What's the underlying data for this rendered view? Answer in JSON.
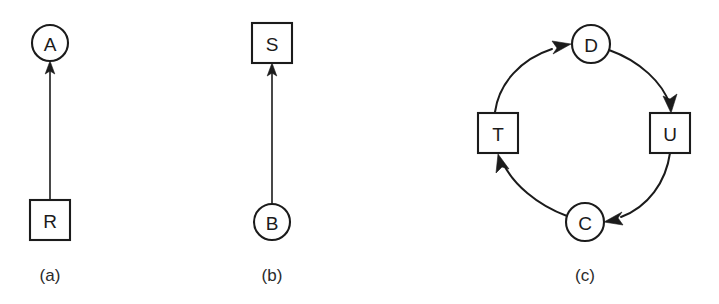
{
  "figure": {
    "width": 719,
    "height": 304,
    "background": "#ffffff",
    "ink": "#1b1b1b"
  },
  "panels": [
    {
      "caption": "(a)",
      "caption_pos": {
        "x": 50,
        "y": 275
      },
      "nodes": [
        {
          "id": "A",
          "label": "A",
          "shape": "circle",
          "cx": 50,
          "cy": 43,
          "r": 18
        },
        {
          "id": "R",
          "label": "R",
          "shape": "square",
          "x": 30,
          "y": 200,
          "w": 40,
          "h": 40
        }
      ],
      "edges": [
        {
          "from": "R",
          "to": "A",
          "kind": "straight",
          "x1": 50,
          "y1": 200,
          "x2": 50,
          "y2": 62,
          "arrow_at": "to"
        }
      ]
    },
    {
      "caption": "(b)",
      "caption_pos": {
        "x": 272,
        "y": 275
      },
      "nodes": [
        {
          "id": "S",
          "label": "S",
          "shape": "square",
          "x": 252,
          "y": 23,
          "w": 40,
          "h": 40
        },
        {
          "id": "B",
          "label": "B",
          "shape": "circle",
          "cx": 272,
          "cy": 222,
          "r": 18
        }
      ],
      "edges": [
        {
          "from": "B",
          "to": "S",
          "kind": "straight",
          "x1": 272,
          "y1": 204,
          "x2": 272,
          "y2": 64,
          "arrow_at": "to"
        }
      ]
    },
    {
      "caption": "(c)",
      "caption_pos": {
        "x": 585,
        "y": 275
      },
      "nodes": [
        {
          "id": "D",
          "label": "D",
          "shape": "circle",
          "cx": 591,
          "cy": 44,
          "r": 19
        },
        {
          "id": "U",
          "label": "U",
          "shape": "square",
          "x": 650,
          "y": 113,
          "w": 40,
          "h": 40
        },
        {
          "id": "C",
          "label": "C",
          "shape": "circle",
          "cx": 585,
          "cy": 222,
          "r": 19
        },
        {
          "id": "T",
          "label": "T",
          "shape": "square",
          "x": 478,
          "y": 113,
          "w": 40,
          "h": 40
        }
      ],
      "edges": [
        {
          "from": "T",
          "to": "D",
          "kind": "arc",
          "arrow_at": "to"
        },
        {
          "from": "D",
          "to": "U",
          "kind": "arc",
          "arrow_at": "to"
        },
        {
          "from": "U",
          "to": "C",
          "kind": "arc",
          "arrow_at": "to"
        },
        {
          "from": "C",
          "to": "T",
          "kind": "arc",
          "arrow_at": "to"
        }
      ],
      "cycle": [
        "T",
        "D",
        "U",
        "C",
        "T"
      ]
    }
  ]
}
